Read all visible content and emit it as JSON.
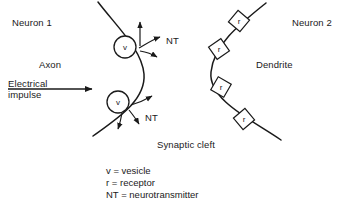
{
  "diagram": {
    "labels": {
      "neuron1": "Neuron 1",
      "neuron2": "Neuron 2",
      "axon": "Axon",
      "dendrite": "Dendrite",
      "electrical_impulse_line1": "Electrical",
      "electrical_impulse_line2": "impulse",
      "neurotransmitter_top": "NT",
      "neurotransmitter_bottom": "NT",
      "synaptic_cleft": "Synaptic cleft"
    },
    "vesicles": [
      {
        "glyph": "v",
        "cx": 125,
        "cy": 47,
        "r": 11
      },
      {
        "glyph": "v",
        "cx": 118,
        "cy": 102,
        "r": 11
      }
    ],
    "receptors": [
      {
        "glyph": "r",
        "cx": 239,
        "cy": 21
      },
      {
        "glyph": "r",
        "cx": 219,
        "cy": 49
      },
      {
        "glyph": "r",
        "cx": 221,
        "cy": 87
      },
      {
        "glyph": "r",
        "cx": 244,
        "cy": 119
      }
    ],
    "legend": [
      "v = vesicle",
      "r = receptor",
      "NT = neurotransmitter"
    ],
    "colors": {
      "ink": "#1a1a1a",
      "background": "#ffffff"
    }
  }
}
